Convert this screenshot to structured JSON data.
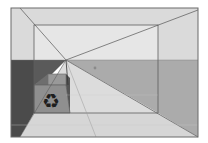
{
  "diagram": {
    "canvas": {
      "width": 208,
      "height": 143,
      "background": "#ffffff"
    },
    "frame": {
      "x1": 11,
      "y1": 8,
      "x2": 198,
      "y2": 137,
      "stroke": "#6a6a6a"
    },
    "inner_rect": {
      "x1": 34,
      "y1": 25,
      "x2": 158,
      "y2": 113,
      "stroke": "#5e5e5e"
    },
    "horizon_y": 60,
    "vanishing_point": {
      "x": 66,
      "y": 60
    },
    "colors": {
      "ceiling": "#d4d4d4",
      "sky_light": "#ececec",
      "left_wall": "#4a4a4a",
      "left_wall_upper": "#5c5c5c",
      "right_wall": "#a9a9a9",
      "floor": "#d0d0d0",
      "floor_light": "#e2e2e2",
      "bin_body": "#8e8e8e",
      "bin_lid": "#9c9c9c",
      "line": "#555555",
      "dot": "#8a8a8a"
    },
    "recycle_bin": {
      "icon": "recycle-icon",
      "glyph": "♻"
    },
    "marker_dot": {
      "x": 95,
      "y": 68
    }
  }
}
